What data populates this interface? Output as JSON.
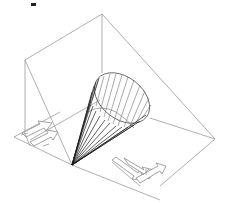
{
  "figure": {
    "type": "technical line drawing",
    "colors": {
      "background": "#ffffff",
      "box_edges": "#9a9a9a",
      "cone_generators": "#1a1a1a",
      "cone_ribs": "#707070",
      "arrows": "#8a8a8a"
    },
    "box_vertices": {
      "top": [
        102,
        14
      ],
      "left_top": [
        25,
        60
      ],
      "right": [
        215,
        139
      ],
      "left_bottom": [
        14,
        137
      ],
      "apex_corner": [
        72,
        165
      ],
      "bottom_front": [
        160,
        200
      ]
    },
    "cone": {
      "apex": [
        72,
        165
      ],
      "base_center": [
        122,
        100
      ],
      "base_rx": 32,
      "base_ry": 22,
      "base_rotation_deg": 35,
      "generator_count": 16,
      "rib_count": 12
    },
    "arrows": [
      {
        "label": "left-floor-arrow",
        "from": [
          20,
          138
        ],
        "to": [
          52,
          124
        ]
      },
      {
        "label": "right-floor-arrow",
        "from": [
          112,
          165
        ],
        "to": [
          150,
          182
        ]
      }
    ]
  }
}
